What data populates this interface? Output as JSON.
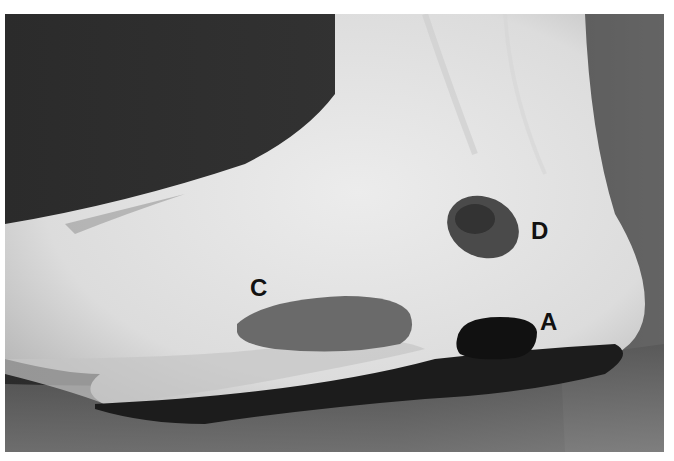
{
  "figure": {
    "labels": [
      {
        "id": "D",
        "text": "D",
        "x": 531,
        "y": 219
      },
      {
        "id": "C",
        "text": "C",
        "x": 250,
        "y": 276
      },
      {
        "id": "A",
        "text": "A",
        "x": 540,
        "y": 310
      }
    ],
    "colors": {
      "background_dark": "#2a2a2a",
      "skin": "#e2e2e2",
      "mark_dark": "#161616",
      "mark_mid": "#555555",
      "border": "#ffffff"
    }
  }
}
